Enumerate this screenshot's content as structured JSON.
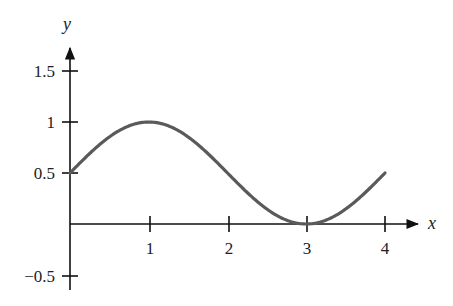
{
  "chart_data": {
    "type": "line",
    "title": "",
    "xlabel": "x",
    "ylabel": "y",
    "x_ticks": [
      1,
      2,
      3,
      4
    ],
    "x_tick_labels": [
      "1",
      "2",
      "3",
      "4"
    ],
    "y_ticks": [
      1.5,
      1,
      0.5,
      -0.5
    ],
    "y_tick_labels": [
      "1.5",
      "1",
      "0.5",
      "−0.5"
    ],
    "xlim": [
      0,
      4.4
    ],
    "ylim": [
      -0.5,
      1.7
    ],
    "grid": false,
    "legend": null,
    "series": [
      {
        "name": "curve",
        "function": "y = 0.5 + 0.5*sin(pi*x/2)",
        "color": "#555555",
        "x": [
          0,
          0.5,
          1,
          1.5,
          2,
          2.5,
          3,
          3.5,
          4
        ],
        "values": [
          0.5,
          0.85,
          1.0,
          0.85,
          0.5,
          0.15,
          0.0,
          0.15,
          0.5
        ]
      }
    ]
  },
  "axes": {
    "x_label": "x",
    "y_label": "y",
    "x_ticks": [
      {
        "label": "1",
        "px": 150
      },
      {
        "label": "2",
        "px": 229
      },
      {
        "label": "3",
        "px": 307
      },
      {
        "label": "4",
        "px": 385
      }
    ],
    "y_ticks": [
      {
        "label": "1.5",
        "py": 71
      },
      {
        "label": "1",
        "py": 122
      },
      {
        "label": "0.5",
        "py": 173
      },
      {
        "label": "−0.5",
        "py": 276
      }
    ]
  }
}
